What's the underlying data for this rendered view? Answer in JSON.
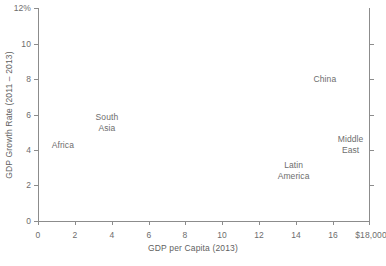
{
  "chart_data": {
    "type": "scatter",
    "title": "",
    "subtitle": "",
    "xlabel": "GDP per Capita (2013)",
    "ylabel": "GDP Growth Rate (2011 – 2013)",
    "xlim": [
      0,
      18
    ],
    "ylim": [
      0,
      12
    ],
    "grid": false,
    "legend": "none",
    "xticks": [
      0,
      2,
      4,
      6,
      8,
      10,
      12,
      14,
      16,
      18
    ],
    "xticklabels": [
      "0",
      "2",
      "4",
      "6",
      "8",
      "10",
      "12",
      "14",
      "16",
      "$18,000"
    ],
    "yticks": [
      0,
      2,
      4,
      6,
      8,
      10,
      12
    ],
    "yticklabels": [
      "0",
      "2",
      "4",
      "6",
      "8",
      "10",
      "12%"
    ],
    "point_style": "text-label-only",
    "points": [
      {
        "label": "Africa",
        "label_lines": [
          "Africa"
        ],
        "x": 1.35,
        "y": 4.3
      },
      {
        "label": "South Asia",
        "label_lines": [
          "South",
          "Asia"
        ],
        "x": 3.75,
        "y": 5.5
      },
      {
        "label": "China",
        "label_lines": [
          "China"
        ],
        "x": 15.6,
        "y": 8.0
      },
      {
        "label": "Middle East",
        "label_lines": [
          "Middle",
          "East"
        ],
        "x": 17.0,
        "y": 4.3
      },
      {
        "label": "Latin America",
        "label_lines": [
          "Latin",
          "America"
        ],
        "x": 13.9,
        "y": 2.8
      }
    ],
    "colors": {
      "axis": "#8c8c8c",
      "text": "#6d6d6d",
      "background": "#ffffff"
    }
  }
}
